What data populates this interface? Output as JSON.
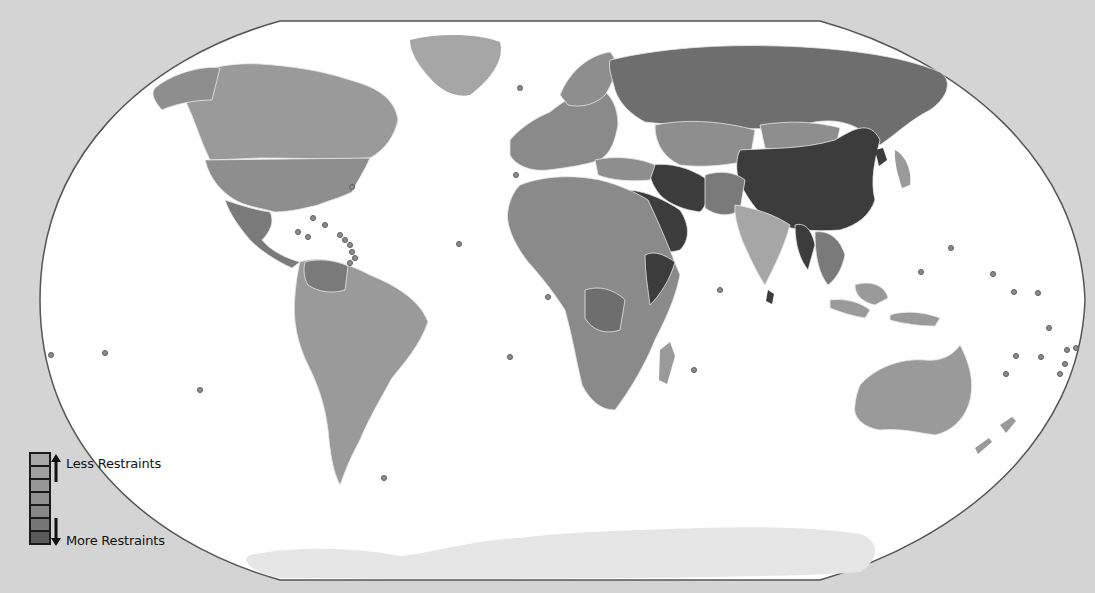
{
  "map": {
    "background_color": "#d4d4d4",
    "ocean_color": "#ffffff",
    "antarctica_color": "#e4e4e4",
    "border_color": "#e8e8e8",
    "shades": {
      "level1": "#a6a6a6",
      "level2": "#9a9a9a",
      "level3": "#8e8e8e",
      "level4": "#828282",
      "level5": "#747474",
      "level6": "#5e5e5e",
      "level7": "#3c3c3c"
    }
  },
  "legend": {
    "top_label": "Less Restraints",
    "bottom_label": "More Restraints",
    "swatches": [
      "#a8a8a8",
      "#a0a0a0",
      "#989898",
      "#909090",
      "#888888",
      "#777777",
      "#5a5a5a"
    ]
  }
}
